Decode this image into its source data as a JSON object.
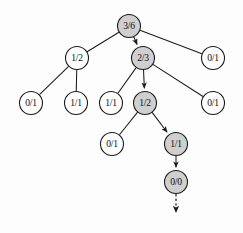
{
  "figure": {
    "background_color": "#fdfdfd",
    "node_stroke_color": "#1b1b1b",
    "node_plain_fill": "#ffffff",
    "node_shaded_fill": "#cfcfcf",
    "edge_color": "#1b1b1b",
    "node_radius": 11.5,
    "width": 243,
    "height": 233
  },
  "nodes": [
    {
      "id": "n0",
      "label": "3/6",
      "x": 129,
      "y": 26,
      "shaded": true,
      "level": 0
    },
    {
      "id": "n1",
      "label": "1/2",
      "x": 77,
      "y": 58,
      "shaded": false,
      "level": 1
    },
    {
      "id": "n2",
      "label": "2/3",
      "x": 143,
      "y": 58,
      "shaded": true,
      "level": 1
    },
    {
      "id": "n3",
      "label": "0/1",
      "x": 213,
      "y": 58,
      "shaded": false,
      "level": 1
    },
    {
      "id": "n4",
      "label": "0/1",
      "x": 31,
      "y": 103,
      "shaded": false,
      "level": 2
    },
    {
      "id": "n5",
      "label": "1/1",
      "x": 76,
      "y": 103,
      "shaded": false,
      "level": 2
    },
    {
      "id": "n6",
      "label": "1/1",
      "x": 111,
      "y": 103,
      "shaded": false,
      "level": 2
    },
    {
      "id": "n7",
      "label": "1/2",
      "x": 145,
      "y": 103,
      "shaded": true,
      "level": 2
    },
    {
      "id": "n8",
      "label": "0/1",
      "x": 213,
      "y": 103,
      "shaded": false,
      "level": 2
    },
    {
      "id": "n9",
      "label": "0/1",
      "x": 112,
      "y": 144,
      "shaded": false,
      "level": 3
    },
    {
      "id": "n10",
      "label": "1/1",
      "x": 176,
      "y": 144,
      "shaded": true,
      "level": 3
    },
    {
      "id": "n11",
      "label": "0/0",
      "x": 176,
      "y": 182,
      "shaded": true,
      "level": 4
    }
  ],
  "edges": [
    {
      "from": "n0",
      "to": "n1",
      "arrow": false
    },
    {
      "from": "n0",
      "to": "n2",
      "arrow": true
    },
    {
      "from": "n0",
      "to": "n3",
      "arrow": false
    },
    {
      "from": "n1",
      "to": "n4",
      "arrow": false
    },
    {
      "from": "n1",
      "to": "n5",
      "arrow": false
    },
    {
      "from": "n2",
      "to": "n6",
      "arrow": false
    },
    {
      "from": "n2",
      "to": "n7",
      "arrow": true
    },
    {
      "from": "n2",
      "to": "n8",
      "arrow": false
    },
    {
      "from": "n7",
      "to": "n9",
      "arrow": false
    },
    {
      "from": "n7",
      "to": "n10",
      "arrow": true
    },
    {
      "from": "n10",
      "to": "n11",
      "arrow": true
    }
  ],
  "terminal_arrow": {
    "id": "expansion-arrow",
    "from_x": 176,
    "from_y": 194,
    "to_x": 176,
    "to_y": 216,
    "style": "dashed",
    "arrow": true
  }
}
